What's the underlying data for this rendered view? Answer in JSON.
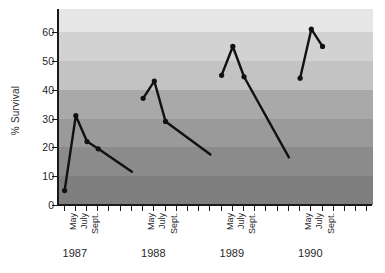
{
  "chart_data": {
    "type": "line",
    "title": "",
    "subtitle": "",
    "xlabel": "",
    "ylabel": "% Survival",
    "ylim": [
      0,
      68
    ],
    "yticks": [
      0,
      10,
      20,
      30,
      40,
      50,
      60
    ],
    "ytick_labels": [
      "0",
      "10",
      "20",
      "30",
      "40",
      "50",
      "60"
    ],
    "grid": false,
    "legend": "none",
    "background_bands": [
      {
        "from": 60,
        "to": 68,
        "color": "#e6e6e6"
      },
      {
        "from": 50,
        "to": 60,
        "color": "#d2d2d2"
      },
      {
        "from": 40,
        "to": 50,
        "color": "#c3c3c3"
      },
      {
        "from": 30,
        "to": 40,
        "color": "#a9a9a9"
      },
      {
        "from": 20,
        "to": 30,
        "color": "#9a9a9a"
      },
      {
        "from": 10,
        "to": 20,
        "color": "#8b8b8b"
      },
      {
        "from": 0,
        "to": 10,
        "color": "#7f7f7f"
      }
    ],
    "line_color": "#111111",
    "marker_color": "#111111",
    "groups": [
      "1987",
      "1988",
      "1989",
      "1990"
    ],
    "month_labels": [
      "May",
      "July",
      "Sept."
    ],
    "x_tick_count": 28,
    "series": [
      {
        "name": "% Survival",
        "segments": [
          {
            "group": "1987",
            "x": [
              0,
              1,
              2,
              3,
              6
            ],
            "points": [
              {
                "month": "May",
                "value": 5
              },
              {
                "month": "June",
                "value": 31
              },
              {
                "month": "July",
                "value": 22
              },
              {
                "month": "Sept.",
                "value": 19.5
              },
              {
                "month": "",
                "value": 11.5
              }
            ]
          },
          {
            "group": "1988",
            "x": [
              7,
              8,
              9,
              13
            ],
            "points": [
              {
                "month": "May",
                "value": 37
              },
              {
                "month": "July",
                "value": 43
              },
              {
                "month": "Sept.",
                "value": 29
              },
              {
                "month": "",
                "value": 17.5
              }
            ]
          },
          {
            "group": "1989",
            "x": [
              14,
              15,
              16,
              20
            ],
            "points": [
              {
                "month": "May",
                "value": 45
              },
              {
                "month": "July",
                "value": 55
              },
              {
                "month": "Sept.",
                "value": 44.5
              },
              {
                "month": "",
                "value": 16.5
              }
            ]
          },
          {
            "group": "1990",
            "x": [
              21,
              22,
              23
            ],
            "points": [
              {
                "month": "May",
                "value": 44
              },
              {
                "month": "July",
                "value": 61
              },
              {
                "month": "Sept.",
                "value": 55
              }
            ]
          }
        ]
      }
    ],
    "group_tick_indices": {
      "1987": [
        0,
        1,
        2
      ],
      "1988": [
        7,
        8,
        9
      ],
      "1989": [
        14,
        15,
        16
      ],
      "1990": [
        21,
        22,
        23
      ]
    }
  }
}
